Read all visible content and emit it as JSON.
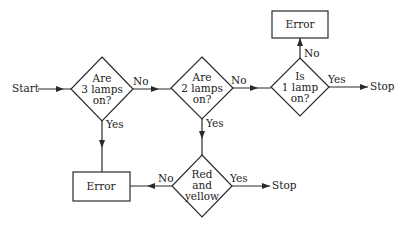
{
  "diagram": {
    "type": "flowchart",
    "start_label": "Start",
    "nodes": {
      "d1": {
        "kind": "decision",
        "lines": [
          "Are",
          "3 lamps",
          "on?"
        ]
      },
      "d2": {
        "kind": "decision",
        "lines": [
          "Are",
          "2 lamps",
          "on?"
        ]
      },
      "d3": {
        "kind": "decision",
        "lines": [
          "Is",
          "1 lamp",
          "on?"
        ]
      },
      "d4": {
        "kind": "decision",
        "lines": [
          "Red",
          "and",
          "yellow"
        ]
      },
      "err_top": {
        "kind": "process",
        "label": "Error"
      },
      "err_bottom": {
        "kind": "process",
        "label": "Error"
      }
    },
    "edges": {
      "d1_no": "No",
      "d1_yes": "Yes",
      "d2_no": "No",
      "d2_yes": "Yes",
      "d3_no": "No",
      "d3_yes": "Yes",
      "d4_no": "No",
      "d4_yes": "Yes"
    },
    "terminals": {
      "stop_1": "Stop",
      "stop_2": "Stop"
    }
  }
}
